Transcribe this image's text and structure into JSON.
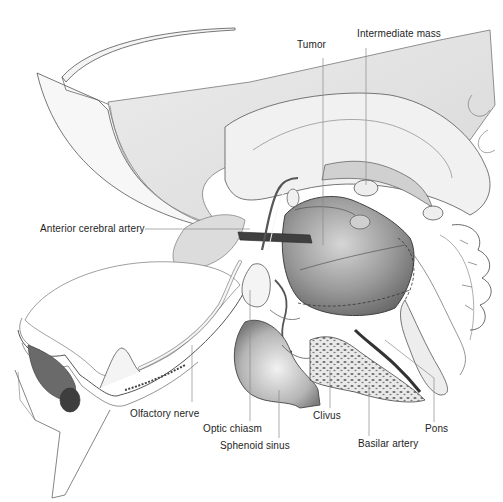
{
  "figure": {
    "ink_color": "#3a3a3a",
    "shade_light": "#e4e4e4",
    "shade_mid": "#b8b8b8",
    "shade_dark": "#5a5a5a",
    "artery_color": "#3c3c3c"
  },
  "labels": [
    {
      "id": "tumor",
      "text": "Tumor",
      "x": 297,
      "y": 45
    },
    {
      "id": "intermediate-mass",
      "text": "Intermediate mass",
      "x": 357,
      "y": 34
    },
    {
      "id": "anterior-cerebral-artery",
      "text": "Anterior cerebral artery",
      "x": 40,
      "y": 222
    },
    {
      "id": "olfactory-nerve",
      "text": "Olfactory nerve",
      "x": 130,
      "y": 407
    },
    {
      "id": "clivus",
      "text": "Clivus",
      "x": 313,
      "y": 413
    },
    {
      "id": "optic-chiasm",
      "text": "Optic chiasm",
      "x": 203,
      "y": 426
    },
    {
      "id": "pons",
      "text": "Pons",
      "x": 425,
      "y": 427
    },
    {
      "id": "sphenoid-sinus",
      "text": "Sphenoid sinus",
      "x": 220,
      "y": 443
    },
    {
      "id": "basilar-artery",
      "text": "Basilar artery",
      "x": 358,
      "y": 441
    }
  ],
  "leaders": [
    {
      "id": "tumor-leader",
      "x1": 323,
      "y1": 58,
      "x2": 323,
      "y2": 245
    },
    {
      "id": "intermediate-mass-leader",
      "x1": 366,
      "y1": 48,
      "x2": 366,
      "y2": 185
    },
    {
      "id": "anterior-cerebral-artery-leader",
      "x1": 145,
      "y1": 229,
      "x2": 250,
      "y2": 229
    },
    {
      "id": "olfactory-nerve-leader",
      "x1": 192,
      "y1": 345,
      "x2": 192,
      "y2": 402
    },
    {
      "id": "clivus-leader",
      "x1": 330,
      "y1": 370,
      "x2": 330,
      "y2": 408
    },
    {
      "id": "optic-chiasm-leader",
      "x1": 250,
      "y1": 290,
      "x2": 250,
      "y2": 421
    },
    {
      "id": "pons-leader",
      "x1": 385,
      "y1": 340,
      "x2": 434,
      "y2": 378
    },
    {
      "id": "pons-leader-vertical",
      "x1": 434,
      "y1": 378,
      "x2": 434,
      "y2": 422
    },
    {
      "id": "sphenoid-sinus-leader",
      "x1": 279,
      "y1": 390,
      "x2": 279,
      "y2": 438
    },
    {
      "id": "basilar-artery-leader",
      "x1": 369,
      "y1": 385,
      "x2": 369,
      "y2": 436
    }
  ]
}
